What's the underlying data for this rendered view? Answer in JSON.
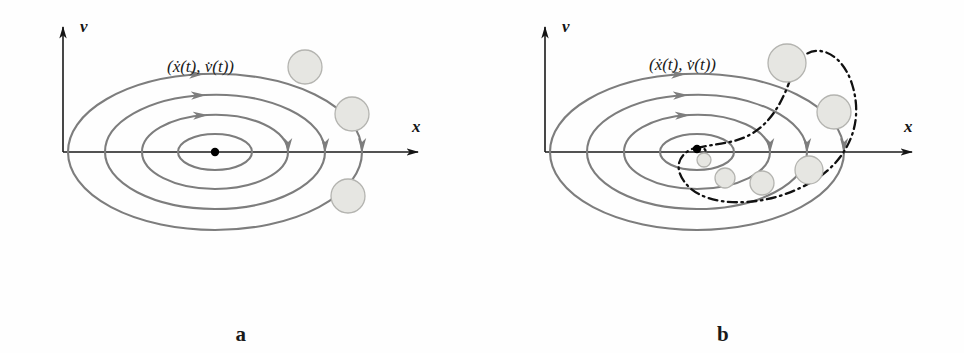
{
  "figure": {
    "type": "diagram",
    "background_color": "#fefefe",
    "width": 964,
    "height": 353
  },
  "colors": {
    "orbit_stroke": "#7d7d7d",
    "axis_stroke": "#1a1a1a",
    "ball_fill": "#e6e6e2",
    "ball_stroke": "#b4b4b0",
    "spiral_stroke": "#111111",
    "equilibrium_dot": "#000000",
    "text": "#1a1a1a"
  },
  "panels": [
    {
      "id": "a",
      "caption": "a",
      "axis": {
        "x_label": "x",
        "y_label": "v",
        "origin_x": 63,
        "origin_y": 152
      },
      "state_label": {
        "open": "(",
        "x_dot": "ẋ",
        "x_arg": "(t)",
        "comma": ", ",
        "v_dot": "v̇",
        "v_arg": "(t)",
        "close": ")",
        "plain": "(ẋ(t), v̇(t))"
      },
      "orbit_count": 4,
      "orbits": [
        {
          "rx": 37,
          "ry": 18
        },
        {
          "rx": 73,
          "ry": 37
        },
        {
          "rx": 110,
          "ry": 57
        },
        {
          "rx": 147,
          "ry": 78
        }
      ],
      "orbit_center": {
        "cx": 215,
        "cy": 152
      },
      "balls": [
        {
          "cx": 305,
          "cy": 67,
          "r": 17
        },
        {
          "cx": 352,
          "cy": 114,
          "r": 17
        },
        {
          "cx": 348,
          "cy": 196,
          "r": 17
        }
      ],
      "equilibrium_point": {
        "cx": 215,
        "cy": 152,
        "r": 4
      },
      "arrow_direction": "clockwise"
    },
    {
      "id": "b",
      "caption": "b",
      "axis": {
        "x_label": "x",
        "y_label": "v",
        "origin_x": 63,
        "origin_y": 152
      },
      "state_label": {
        "open": "(",
        "x_dot": "ẋ",
        "x_arg": "(t)",
        "comma": ", ",
        "v_dot": "v̇",
        "v_arg": "(t)",
        "close": ")",
        "plain": "(ẋ(t), v̇(t))"
      },
      "orbit_count": 4,
      "orbits": [
        {
          "rx": 37,
          "ry": 18
        },
        {
          "rx": 73,
          "ry": 37
        },
        {
          "rx": 110,
          "ry": 57
        },
        {
          "rx": 147,
          "ry": 78
        }
      ],
      "orbit_center": {
        "cx": 215,
        "cy": 152
      },
      "spiral": {
        "style": "dash-dot",
        "direction": "inward-clockwise",
        "turns": 1.75
      },
      "balls": [
        {
          "cx": 305,
          "cy": 63,
          "r": 19
        },
        {
          "cx": 352,
          "cy": 112,
          "r": 17
        },
        {
          "cx": 327,
          "cy": 170,
          "r": 14
        },
        {
          "cx": 280,
          "cy": 183,
          "r": 12
        },
        {
          "cx": 243,
          "cy": 178,
          "r": 10
        },
        {
          "cx": 222,
          "cy": 160,
          "r": 7
        }
      ],
      "equilibrium_point": {
        "cx": 215,
        "cy": 149,
        "r": 4
      },
      "arrow_direction": "clockwise"
    }
  ]
}
